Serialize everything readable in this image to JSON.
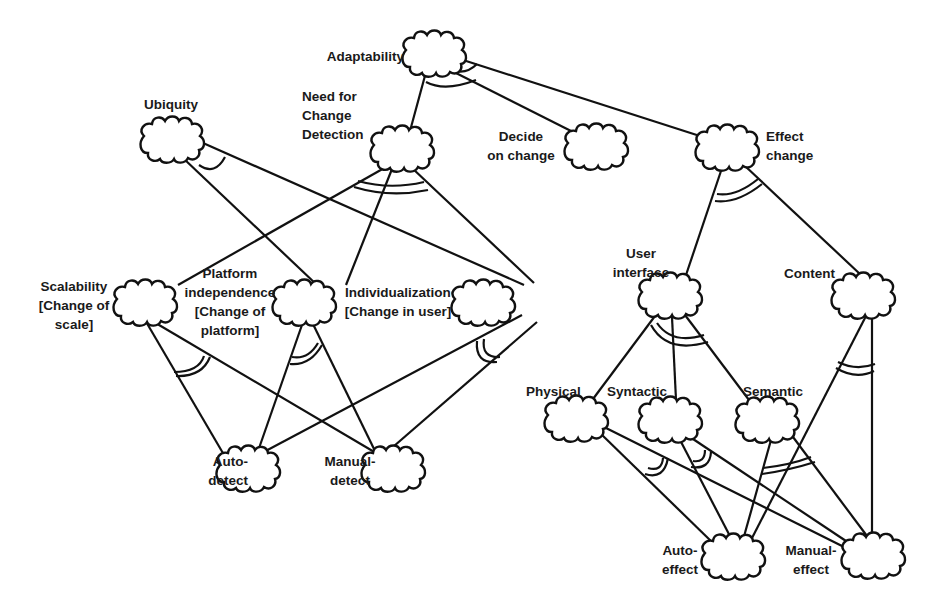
{
  "diagram": {
    "type": "goal-decomposition-tree",
    "nodes": {
      "adaptability": {
        "label": [
          "Adaptability"
        ]
      },
      "ubiquity": {
        "label": [
          "Ubiquity"
        ]
      },
      "need_detection": {
        "label": [
          "Need for",
          "Change",
          "Detection"
        ]
      },
      "decide": {
        "label": [
          "Decide",
          "on change"
        ]
      },
      "effect": {
        "label": [
          "Effect",
          "change"
        ]
      },
      "scalability": {
        "label": [
          "Scalability",
          "[Change of",
          "scale]"
        ]
      },
      "platform": {
        "label": [
          "Platform",
          "independence",
          "[Change of",
          "platform]"
        ]
      },
      "individualization": {
        "label": [
          "Individualization",
          "[Change in user]"
        ]
      },
      "user_interface": {
        "label": [
          "User",
          "interface"
        ]
      },
      "content": {
        "label": [
          "Content"
        ]
      },
      "physical": {
        "label": [
          "Physical"
        ]
      },
      "syntactic": {
        "label": [
          "Syntactic"
        ]
      },
      "semantic": {
        "label": [
          "Semantic"
        ]
      },
      "auto_detect": {
        "label": [
          "Auto-",
          "detect"
        ]
      },
      "manual_detect": {
        "label": [
          "Manual-",
          "detect"
        ]
      },
      "auto_effect": {
        "label": [
          "Auto-",
          "effect"
        ]
      },
      "manual_effect": {
        "label": [
          "Manual-",
          "effect"
        ]
      }
    },
    "edges": [
      [
        "adaptability",
        "need_detection"
      ],
      [
        "adaptability",
        "decide"
      ],
      [
        "adaptability",
        "effect"
      ],
      [
        "ubiquity",
        "platform"
      ],
      [
        "ubiquity",
        "individualization"
      ],
      [
        "need_detection",
        "scalability"
      ],
      [
        "need_detection",
        "platform"
      ],
      [
        "need_detection",
        "individualization"
      ],
      [
        "effect",
        "user_interface"
      ],
      [
        "effect",
        "content"
      ],
      [
        "scalability",
        "auto_detect"
      ],
      [
        "scalability",
        "manual_detect"
      ],
      [
        "platform",
        "auto_detect"
      ],
      [
        "platform",
        "manual_detect"
      ],
      [
        "individualization",
        "auto_detect"
      ],
      [
        "individualization",
        "manual_detect"
      ],
      [
        "user_interface",
        "physical"
      ],
      [
        "user_interface",
        "syntactic"
      ],
      [
        "user_interface",
        "semantic"
      ],
      [
        "content",
        "auto_effect"
      ],
      [
        "content",
        "manual_effect"
      ],
      [
        "physical",
        "auto_effect"
      ],
      [
        "physical",
        "manual_effect"
      ],
      [
        "syntactic",
        "auto_effect"
      ],
      [
        "syntactic",
        "manual_effect"
      ],
      [
        "semantic",
        "auto_effect"
      ],
      [
        "semantic",
        "manual_effect"
      ]
    ]
  }
}
